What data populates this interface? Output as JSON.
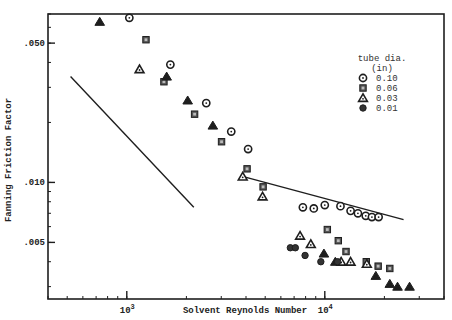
{
  "chart_data": {
    "type": "scatter",
    "title": "",
    "xlabel": "Solvent Reynolds Number",
    "ylabel": "Fanning Friction Factor",
    "xscale": "log",
    "yscale": "log",
    "xlim": [
      400,
      40000
    ],
    "ylim": [
      0.0026,
      0.07
    ],
    "grid": false,
    "x_ticks": [
      {
        "value": 1000,
        "label": "10^3",
        "base": "10",
        "exp": "3"
      },
      {
        "value": 10000,
        "label": "10^4",
        "base": "10",
        "exp": "4"
      }
    ],
    "y_ticks": [
      {
        "value": 0.05,
        "label": ".050"
      },
      {
        "value": 0.01,
        "label": ".010"
      },
      {
        "value": 0.005,
        "label": ".005"
      }
    ],
    "legend": {
      "title_line1": "tube dia.",
      "title_line2": "(in)",
      "position": "upper right",
      "entries": [
        {
          "label": "0.10",
          "marker": "open-circle"
        },
        {
          "label": "0.06",
          "marker": "square"
        },
        {
          "label": "0.03",
          "marker": "open-triangle"
        },
        {
          "label": "0.01",
          "marker": "filled-circle"
        }
      ]
    },
    "lines": [
      {
        "name": "laminar-reference",
        "points": [
          [
            520,
            0.034
          ],
          [
            2180,
            0.0075
          ]
        ]
      },
      {
        "name": "turbulent-reference",
        "points": [
          [
            3880,
            0.0107
          ],
          [
            25000,
            0.0065
          ]
        ]
      }
    ],
    "series": [
      {
        "name": "0.10",
        "marker": "open-circle",
        "points": [
          [
            1030,
            0.067
          ],
          [
            1660,
            0.039
          ],
          [
            2520,
            0.025
          ],
          [
            3370,
            0.018
          ],
          [
            4100,
            0.0147
          ],
          [
            7750,
            0.0075
          ],
          [
            8800,
            0.0074
          ],
          [
            10000,
            0.0077
          ],
          [
            12000,
            0.0076
          ],
          [
            13500,
            0.0072
          ],
          [
            14700,
            0.007
          ],
          [
            16100,
            0.0068
          ],
          [
            17300,
            0.0067
          ],
          [
            18700,
            0.0067
          ]
        ]
      },
      {
        "name": "0.06",
        "marker": "square",
        "points": [
          [
            1250,
            0.052
          ],
          [
            1540,
            0.032
          ],
          [
            2200,
            0.022
          ],
          [
            3010,
            0.016
          ],
          [
            4050,
            0.0117
          ],
          [
            4880,
            0.0095
          ],
          [
            10300,
            0.0058
          ],
          [
            11700,
            0.0051
          ],
          [
            12800,
            0.0045
          ],
          [
            16200,
            0.004
          ],
          [
            18600,
            0.0038
          ],
          [
            21300,
            0.0037
          ]
        ]
      },
      {
        "name": "0.03",
        "marker": "open-triangle",
        "points": [
          [
            1160,
            0.037
          ],
          [
            3850,
            0.0107
          ],
          [
            4850,
            0.0085
          ],
          [
            7500,
            0.0054
          ],
          [
            8500,
            0.0049
          ],
          [
            12100,
            0.004
          ],
          [
            13500,
            0.004
          ],
          [
            16300,
            0.0039
          ]
        ]
      },
      {
        "name": "0.03 (filled)",
        "marker": "filled-triangle",
        "points": [
          [
            730,
            0.064
          ],
          [
            1590,
            0.034
          ],
          [
            2030,
            0.0258
          ],
          [
            2720,
            0.0193
          ],
          [
            9900,
            0.0044
          ],
          [
            11300,
            0.004
          ],
          [
            18100,
            0.0034
          ],
          [
            21300,
            0.0031
          ],
          [
            23300,
            0.003
          ],
          [
            26800,
            0.003
          ]
        ]
      },
      {
        "name": "0.01",
        "marker": "filled-circle",
        "points": [
          [
            6700,
            0.0047
          ],
          [
            7100,
            0.0047
          ],
          [
            7950,
            0.0043
          ],
          [
            9550,
            0.004
          ],
          [
            11600,
            0.004
          ]
        ]
      }
    ]
  },
  "plot_box": {
    "left": 48,
    "top": 14,
    "right": 444,
    "bottom": 299
  },
  "colors": {
    "ink": "#1e1e1e",
    "background": "#ffffff"
  }
}
